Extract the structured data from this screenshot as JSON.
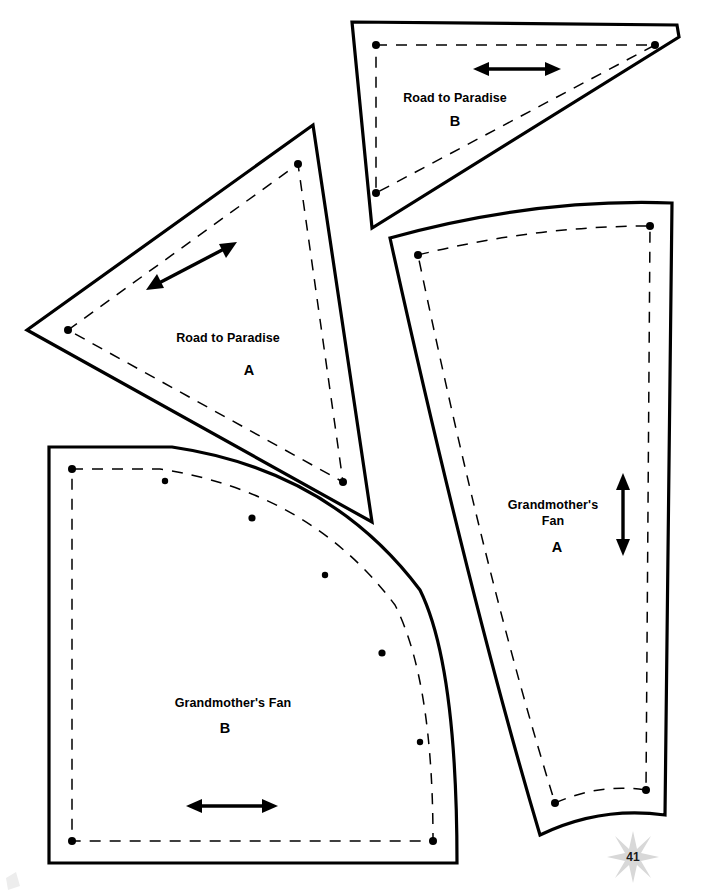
{
  "page": {
    "number": "41",
    "width": 702,
    "height": 894,
    "background_color": "#ffffff",
    "line_color": "#000000",
    "star_color": "#d8d8d8"
  },
  "pieces": [
    {
      "id": "road-to-paradise-b",
      "name": "Road to Paradise",
      "letter": "B",
      "shape": "right-triangle-beveled",
      "label_x": 455,
      "label_y": 102,
      "letter_x": 455,
      "letter_y": 125,
      "cut_path": "M 352 22 L 677 25 L 679 37 L 372 228 Z",
      "seam_path": "M 376 45 L 655 45 L 376 193 Z",
      "seam_dots": [
        {
          "x": 376,
          "y": 45
        },
        {
          "x": 655,
          "y": 45
        },
        {
          "x": 376,
          "y": 193
        }
      ],
      "grain": {
        "orientation": "horizontal",
        "x1": 479,
        "y1": 69,
        "x2": 555,
        "y2": 69
      }
    },
    {
      "id": "road-to-paradise-a",
      "name": "Road to Paradise",
      "letter": "A",
      "shape": "triangle",
      "label_x": 228,
      "label_y": 342,
      "letter_x": 248,
      "letter_y": 372,
      "cut_path": "M 27 330 L 313 125 L 372 522 Z",
      "seam_path": "M 68 330 L 298 164 L 343 482 Z",
      "seam_dots": [
        {
          "x": 68,
          "y": 330
        },
        {
          "x": 298,
          "y": 164
        },
        {
          "x": 343,
          "y": 482
        }
      ],
      "grain": {
        "orientation": "diagonal",
        "x1": 151,
        "y1": 288,
        "x2": 232,
        "y2": 244
      }
    },
    {
      "id": "grandmothers-fan-a",
      "name": "Grandmother's Fan",
      "letter": "A",
      "shape": "tapered-wedge",
      "label_line1": "Grandmother's",
      "label_line2": "Fan",
      "label_x": 553,
      "label_y": 506,
      "label_y2": 521,
      "letter_x": 557,
      "letter_y": 549,
      "cut_path": "M 390 238 Q 535 198 672 203 L 665 815 Q 600 806 540 835 Q 470 600 390 238 Z",
      "seam_path": "M 418 255 Q 535 226 650 226 L 646 790 Q 600 783 555 803 Q 487 585 418 255 Z",
      "seam_dots": [
        {
          "x": 418,
          "y": 255
        },
        {
          "x": 650,
          "y": 226
        },
        {
          "x": 646,
          "y": 790
        },
        {
          "x": 555,
          "y": 803
        }
      ],
      "grain": {
        "orientation": "vertical",
        "x1": 623,
        "y1": 478,
        "x2": 623,
        "y2": 551
      }
    },
    {
      "id": "grandmothers-fan-b",
      "name": "Grandmother's Fan",
      "letter": "B",
      "shape": "quarter-circle",
      "label_x": 233,
      "label_y": 703,
      "letter_x": 225,
      "letter_y": 729,
      "cut_path": "M 49 447 L 172 447 Q 330 470 420 590 Q 457 665 457 863 L 49 863 Z",
      "seam_path": "M 72 469 L 160 469 Q 310 492 395 605 Q 433 680 433 841 L 72 841 Z",
      "seam_dots": [
        {
          "x": 72,
          "y": 469
        },
        {
          "x": 165,
          "y": 481
        },
        {
          "x": 252,
          "y": 518
        },
        {
          "x": 325,
          "y": 575
        },
        {
          "x": 382,
          "y": 653
        },
        {
          "x": 420,
          "y": 742
        },
        {
          "x": 433,
          "y": 841
        },
        {
          "x": 72,
          "y": 841
        }
      ],
      "grain": {
        "orientation": "horizontal",
        "x1": 192,
        "y1": 806,
        "x2": 272,
        "y2": 806
      }
    }
  ]
}
